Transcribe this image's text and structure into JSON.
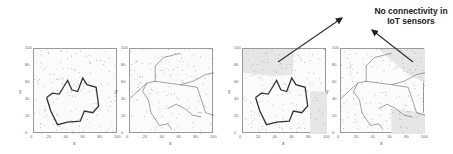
{
  "chart_data": [
    {
      "type": "scatter",
      "panel": 1,
      "xlabel": "x",
      "ylabel": "y",
      "xlim": [
        0,
        100
      ],
      "ylim": [
        0,
        100
      ],
      "xticks": [
        "0",
        "20",
        "40",
        "60",
        "80",
        "100"
      ],
      "yticks": [
        "0",
        "20",
        "40",
        "60",
        "80",
        "100"
      ],
      "description": "Scattered sensor points with a bold closed connectivity boundary region",
      "boundary": [
        [
          15,
          43
        ],
        [
          22,
          48
        ],
        [
          30,
          47
        ],
        [
          35,
          55
        ],
        [
          40,
          63
        ],
        [
          45,
          52
        ],
        [
          52,
          50
        ],
        [
          58,
          66
        ],
        [
          63,
          58
        ],
        [
          74,
          55
        ],
        [
          77,
          33
        ],
        [
          70,
          25
        ],
        [
          60,
          27
        ],
        [
          55,
          15
        ],
        [
          40,
          14
        ],
        [
          28,
          11
        ],
        [
          20,
          27
        ],
        [
          15,
          43
        ]
      ]
    },
    {
      "type": "scatter",
      "panel": 2,
      "xlabel": "x",
      "ylabel": "y",
      "xlim": [
        0,
        100
      ],
      "ylim": [
        0,
        100
      ],
      "xticks": [
        "0",
        "20",
        "40",
        "60",
        "80",
        "100"
      ],
      "yticks": [
        "0",
        "20",
        "40",
        "60",
        "80",
        "100"
      ],
      "description": "Scattered sensor points with thin network boundary lines"
    },
    {
      "type": "scatter",
      "panel": 3,
      "xlabel": "x",
      "ylabel": "y",
      "xlim": [
        0,
        100
      ],
      "ylim": [
        0,
        100
      ],
      "xticks": [
        "0",
        "20",
        "40",
        "60",
        "80",
        "100"
      ],
      "yticks": [
        "0",
        "20",
        "40",
        "60",
        "80",
        "100"
      ],
      "description": "Same as panel 1 with shaded regions lacking connectivity"
    },
    {
      "type": "scatter",
      "panel": 4,
      "xlabel": "x",
      "ylabel": "y",
      "xlim": [
        0,
        100
      ],
      "ylim": [
        0,
        100
      ],
      "xticks": [
        "0",
        "20",
        "40",
        "60",
        "80",
        "100"
      ],
      "yticks": [
        "0",
        "20",
        "40",
        "60",
        "80",
        "100"
      ],
      "description": "Same as panel 2 with shaded regions lacking connectivity"
    }
  ],
  "annotation": {
    "line1": "No connectivity in",
    "line2": "IoT sensors"
  },
  "ticks": [
    "0",
    "20",
    "40",
    "60",
    "80",
    "100"
  ],
  "axes": {
    "x": "x",
    "y": "y"
  }
}
